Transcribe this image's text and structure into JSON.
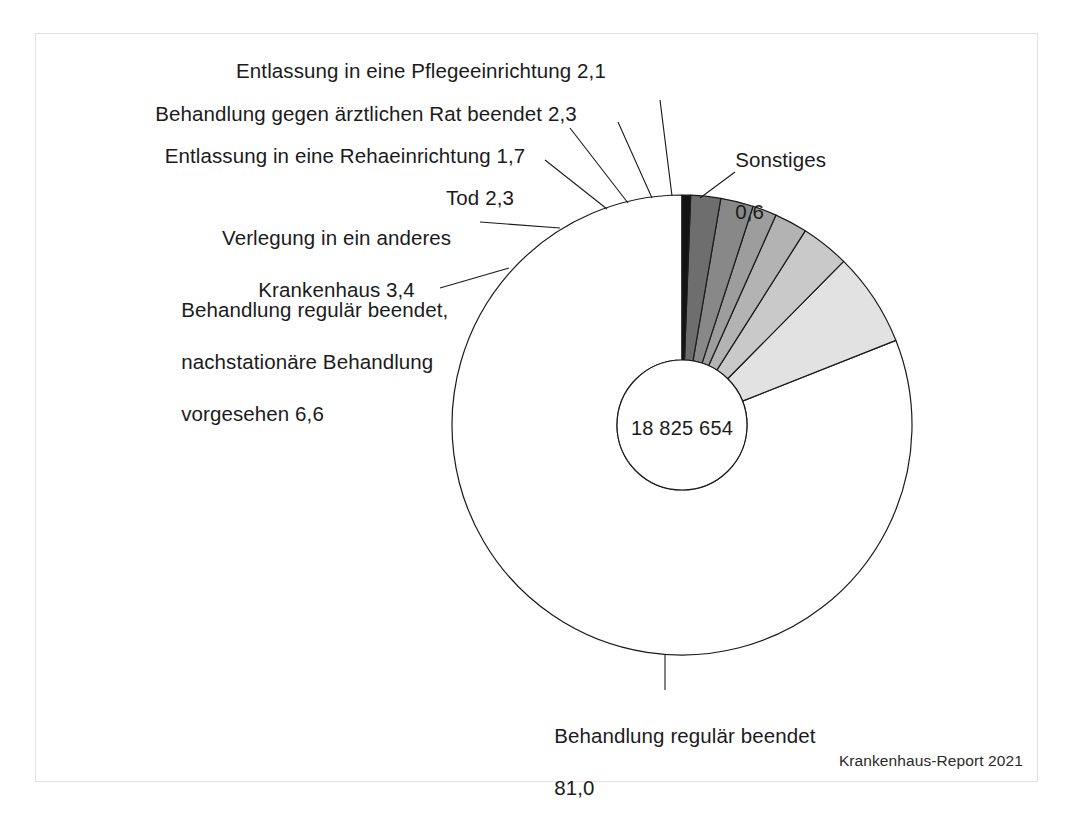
{
  "figure": {
    "center_value": "18 825 654",
    "source": "Krankenhaus-Report 2021"
  },
  "labels": {
    "pflege": "Entlassung in eine Pflegeeinrichtung 2,1",
    "aerztlicher_rat": "Behandlung gegen ärztlichen Rat beendet 2,3",
    "reha": "Entlassung in eine Rehaeinrichtung 1,7",
    "tod": "Tod 2,3",
    "verlegung_l1": "Verlegung in ein anderes",
    "verlegung_l2": "Krankenhaus 3,4",
    "nachstationaer_l1": "Behandlung regulär beendet,",
    "nachstationaer_l2": "nachstationäre Behandlung",
    "nachstationaer_l3": "vorgesehen 6,6",
    "sonstiges_l1": "Sonstiges",
    "sonstiges_l2": "0,6",
    "regulaer_l1": "Behandlung regulär beendet",
    "regulaer_l2": "81,0"
  },
  "chart_data": {
    "type": "pie",
    "variant": "donut",
    "title": "",
    "center_label": "18 825 654",
    "total_cases": 18825654,
    "unit": "Prozent",
    "start_angle_deg": 0,
    "direction": "counterclockwise",
    "outer_radius_px": 230,
    "inner_radius_px": 65,
    "center_px": [
      682,
      425
    ],
    "legend": "labels with leader lines",
    "grid": false,
    "categories": [
      "Behandlung regulär beendet",
      "Behandlung regulär beendet, nachstationäre Behandlung vorgesehen",
      "Verlegung in ein anderes Krankenhaus",
      "Tod",
      "Entlassung in eine Rehaeinrichtung",
      "Behandlung gegen ärztlichen Rat beendet",
      "Entlassung in eine Pflegeeinrichtung",
      "Sonstiges"
    ],
    "values": [
      81.0,
      6.6,
      3.4,
      2.3,
      1.7,
      2.3,
      2.1,
      0.6
    ],
    "value_labels": [
      "81,0",
      "6,6",
      "3,4",
      "2,3",
      "1,7",
      "2,3",
      "2,1",
      "0,6"
    ],
    "colors": [
      "#ffffff",
      "#e2e2e2",
      "#c9c9c9",
      "#b3b3b3",
      "#9d9d9d",
      "#888888",
      "#6e6e6e",
      "#141414"
    ],
    "slice_stroke": "#1b1b1b",
    "source": "Krankenhaus-Report 2021"
  }
}
